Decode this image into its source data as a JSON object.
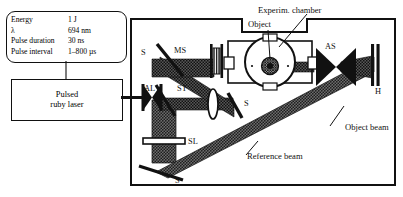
{
  "figure": {
    "specs": [
      {
        "key": "Energy",
        "value": "1 J"
      },
      {
        "key": "λ",
        "value": "694 nm"
      },
      {
        "key": "Pulse duration",
        "value": "30 ns"
      },
      {
        "key": "Pulse interval",
        "value": "1–800 µs"
      }
    ],
    "laser": {
      "line1": "Pulsed",
      "line2": "ruby laser"
    },
    "components": {
      "mirror_top_left": "S",
      "mirror_mid_right": "S",
      "mirror_bottom": "S",
      "microscope_screen": "MS",
      "aperture_stop": "AS",
      "attenuator_lens": "AL",
      "beamsplitter": "ST",
      "spread_lens": "SL",
      "hologram_plate": "H"
    },
    "callouts": {
      "object": "Object",
      "chamber": "Experim. chamber",
      "object_beam": "Object beam",
      "reference_beam": "Reference beam"
    },
    "colors": {
      "ink": "#111111",
      "beam": "#4a4a4a",
      "paper": "#ffffff"
    }
  }
}
